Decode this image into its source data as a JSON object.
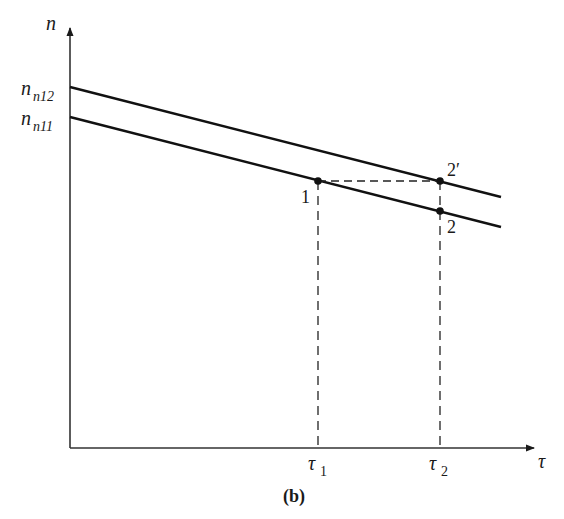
{
  "figure": {
    "caption": "(b)",
    "axes": {
      "y_label": "n",
      "x_label": "τ"
    },
    "y_ticks": [
      {
        "main": "n",
        "sub": "n12"
      },
      {
        "main": "n",
        "sub": "n11"
      }
    ],
    "x_ticks": [
      {
        "main": "τ",
        "sub": "1"
      },
      {
        "main": "τ",
        "sub": "2"
      }
    ],
    "lines": [
      {
        "name": "upper-line",
        "intercept_label": "n_n12"
      },
      {
        "name": "lower-line",
        "intercept_label": "n_n11"
      }
    ],
    "points": [
      {
        "label": "1"
      },
      {
        "label": "2′"
      },
      {
        "label": "2"
      }
    ],
    "colors": {
      "ink": "#1a1a1a",
      "background": "#ffffff"
    }
  }
}
